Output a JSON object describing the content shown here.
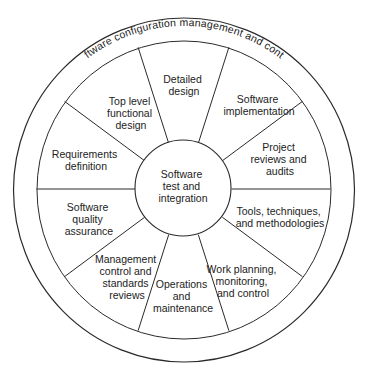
{
  "diagram": {
    "outer_ring_label": "Software configuration management and control",
    "center_label": [
      "Software",
      "test and",
      "integration"
    ],
    "segments": [
      {
        "id": "detailed-design",
        "lines": [
          "Detailed",
          "design"
        ]
      },
      {
        "id": "software-implementation",
        "lines": [
          "Software",
          "implementation"
        ]
      },
      {
        "id": "project-reviews",
        "lines": [
          "Project",
          "reviews and",
          "audits"
        ]
      },
      {
        "id": "tools-techniques",
        "lines": [
          "Tools, techniques,",
          "and methodologies"
        ]
      },
      {
        "id": "work-planning",
        "lines": [
          "Work planning,",
          "monitoring,",
          "and control"
        ]
      },
      {
        "id": "operations-maintenance",
        "lines": [
          "Operations",
          "and",
          "maintenance"
        ]
      },
      {
        "id": "management-control",
        "lines": [
          "Management",
          "control and",
          "standards",
          "reviews"
        ]
      },
      {
        "id": "software-quality",
        "lines": [
          "Software",
          "quality",
          "assurance"
        ]
      },
      {
        "id": "requirements-definition",
        "lines": [
          "Requirements",
          "definition"
        ]
      },
      {
        "id": "top-level-design",
        "lines": [
          "Top level",
          "functional",
          "design"
        ]
      }
    ],
    "colors": {
      "line": "#2a2a2a",
      "text": "#222222",
      "background": "#ffffff"
    }
  }
}
